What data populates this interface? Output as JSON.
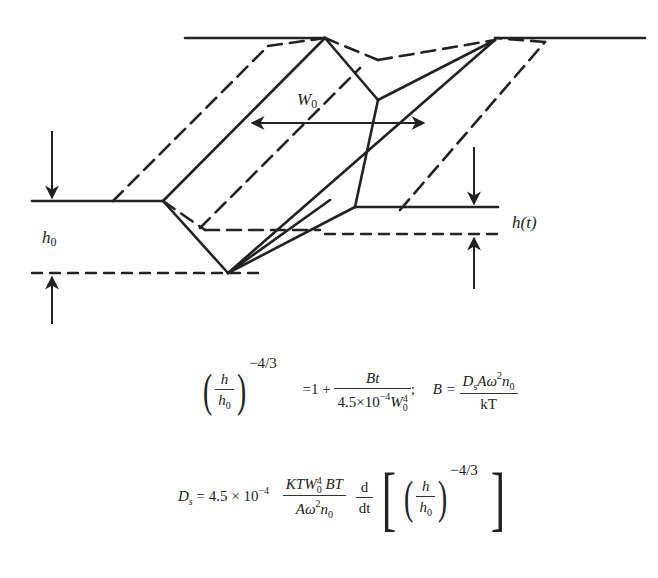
{
  "figure": {
    "type": "grain-boundary groove flattening schematic",
    "labels": {
      "groove_width": "W",
      "groove_width_sub": "0",
      "initial_depth": "h",
      "initial_depth_sub": "0",
      "depth_over_time": "h(t)"
    }
  },
  "equations": {
    "eq1": {
      "lhs_num": "h",
      "lhs_den_base": "h",
      "lhs_den_sub": "0",
      "lhs_exponent": "−4/3",
      "equals": "=1 +",
      "rhs_num": "Bt",
      "rhs_den_coef": "4.5×10",
      "rhs_den_exp": "−4",
      "rhs_den_var": "W",
      "rhs_den_var_sub": "0",
      "rhs_den_var_sup": "4",
      "separator": ";",
      "b_lhs": "B =",
      "b_num_D": "D",
      "b_num_D_sub": "s",
      "b_num_rest": "Aω",
      "b_num_sup": "2",
      "b_num_n": "n",
      "b_num_n_sub": "0",
      "b_den": "kT"
    },
    "eq2": {
      "lhs": "D",
      "lhs_sub": "s",
      "equals_coef": "= 4.5 × 10",
      "coef_exp": "−4",
      "frac_num_a": "KTW",
      "frac_num_sup": "4",
      "frac_num_sub": "0",
      "frac_num_b": "BT",
      "frac_den_a": "Aω",
      "frac_den_sup": "2",
      "frac_den_n": "n",
      "frac_den_n_sub": "0",
      "deriv_num": "d",
      "deriv_den": "dt",
      "inner_num": "h",
      "inner_den": "h",
      "inner_den_sub": "0",
      "inner_exponent": "−4/3"
    }
  }
}
